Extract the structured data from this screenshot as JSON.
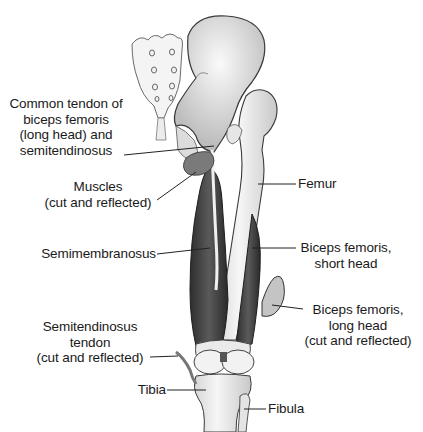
{
  "figure": {
    "labels": {
      "common_tendon": [
        "Common tendon of",
        "biceps femoris",
        "(long head) and",
        "semitendinosus"
      ],
      "muscles_cut": [
        "Muscles",
        "(cut and reflected)"
      ],
      "semimembranosus": [
        "Semimembranosus"
      ],
      "semitendinosus_tendon": [
        "Semitendinosus",
        "tendon",
        "(cut and reflected)"
      ],
      "tibia": [
        "Tibia"
      ],
      "femur": [
        "Femur"
      ],
      "biceps_short": [
        "Biceps femoris,",
        "short head"
      ],
      "biceps_long": [
        "Biceps femoris,",
        "long head",
        "(cut and reflected)"
      ],
      "fibula": [
        "Fibula"
      ]
    },
    "colors": {
      "bone_fill": "#f1f1f1",
      "bone_stroke": "#3a3a3a",
      "muscle_dark": "#3c3c3c",
      "muscle_mid": "#6e6e6e",
      "leader_line": "#222222",
      "text": "#1a1a1a"
    }
  }
}
